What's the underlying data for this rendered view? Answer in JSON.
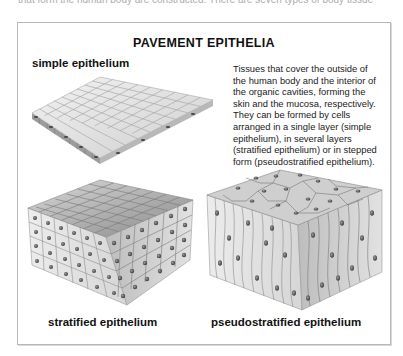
{
  "page": {
    "intro_fragment": "that form the human body are constructed. There are seven types of body tissue"
  },
  "figure": {
    "title": "PAVEMENT EPITHELIA",
    "description": "Tissues that cover the outside of the human body and the interior of the organic cavities, forming the skin and the mucosa, respectively. They can be formed by cells arranged in a single layer (simple epithelium), in several layers (stratified epithelium) or in stepped form (pseudostratified epithelium).",
    "panels": [
      {
        "label": "simple epithelium",
        "illustration": "flat-single-layer-slab"
      },
      {
        "label": "stratified epithelium",
        "illustration": "multi-layer-cube-block"
      },
      {
        "label": "pseudostratified epithelium",
        "illustration": "columnar-cell-block"
      }
    ],
    "colors": {
      "cell_light": "#e6e6e6",
      "cell_mid": "#c4c4c4",
      "cell_dark": "#8e8e8e",
      "nucleus": "#555555",
      "frame_border": "#b8b8b8"
    }
  }
}
